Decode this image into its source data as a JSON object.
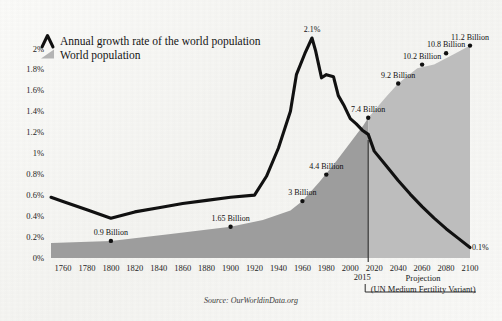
{
  "title": "",
  "source": "Source: OurWorldinData.org",
  "legend": [
    {
      "label": "Annual growth rate of the world population",
      "icon": "peak-line-icon",
      "color": "#111111"
    },
    {
      "label": "World population",
      "icon": "area-wedge-icon",
      "color": "#a8a8a8"
    }
  ],
  "annotations": {
    "divider_year_label": "2015",
    "projection_label": "Projection",
    "projection_sub_label": "(UN Medium Fertility Variant)",
    "peak_label": "2.1%",
    "end_label": "0.1%"
  },
  "colors": {
    "background": "#f7f7f5",
    "line": "#111111",
    "area_historical": "#9d9d9d",
    "area_projection": "#bdbdbd",
    "text": "#1a1a1a"
  },
  "chart_data": {
    "type": "line",
    "title": "",
    "xlabel": "",
    "ylabel": "",
    "xlim": [
      1750,
      2100
    ],
    "ylim": [
      0,
      2.1
    ],
    "grid": false,
    "legend_position": "top-left",
    "x_ticks": [
      1760,
      1780,
      1800,
      1820,
      1840,
      1860,
      1880,
      1900,
      1920,
      1940,
      1960,
      1980,
      2000,
      2020,
      2040,
      2060,
      2080,
      2100
    ],
    "y_ticks": [
      "0%",
      "0.2%",
      "0.4%",
      "0.6%",
      "0.8%",
      "1%",
      "1.2%",
      "1.4%",
      "1.6%",
      "1.8%",
      "2%"
    ],
    "y_tick_values": [
      0,
      0.2,
      0.4,
      0.6,
      0.8,
      1.0,
      1.2,
      1.4,
      1.6,
      1.8,
      2.0
    ],
    "projection_start_year": 2015,
    "series": [
      {
        "name": "Annual growth rate of the world population",
        "unit": "%",
        "x": [
          1750,
          1760,
          1780,
          1800,
          1820,
          1840,
          1860,
          1880,
          1900,
          1920,
          1930,
          1940,
          1950,
          1955,
          1962,
          1968,
          1971,
          1976,
          1980,
          1986,
          1990,
          1995,
          2000,
          2005,
          2010,
          2015,
          2020,
          2030,
          2040,
          2050,
          2060,
          2070,
          2080,
          2090,
          2100
        ],
        "y": [
          0.58,
          0.54,
          0.46,
          0.38,
          0.44,
          0.48,
          0.52,
          0.55,
          0.58,
          0.6,
          0.78,
          1.05,
          1.4,
          1.75,
          1.95,
          2.1,
          1.98,
          1.72,
          1.75,
          1.73,
          1.55,
          1.45,
          1.33,
          1.28,
          1.22,
          1.18,
          1.02,
          0.88,
          0.74,
          0.61,
          0.49,
          0.38,
          0.28,
          0.19,
          0.1
        ]
      },
      {
        "name": "World population",
        "unit": "Billion",
        "x": [
          1750,
          1800,
          1850,
          1900,
          1927,
          1950,
          1960,
          1974,
          1987,
          1999,
          2011,
          2015,
          2030,
          2040,
          2056,
          2070,
          2088,
          2100
        ],
        "y": [
          0.79,
          0.9,
          1.26,
          1.65,
          2.0,
          2.5,
          3.0,
          4.0,
          5.0,
          6.0,
          7.0,
          7.4,
          8.5,
          9.2,
          10.0,
          10.2,
          10.8,
          11.2
        ]
      }
    ],
    "data_labels": [
      {
        "text": "0.9 Billion",
        "year": 1800,
        "value": 0.9,
        "series": "World population"
      },
      {
        "text": "1.65 Billion",
        "year": 1900,
        "value": 1.65,
        "series": "World population"
      },
      {
        "text": "3 Billion",
        "year": 1960,
        "value": 3.0,
        "series": "World population"
      },
      {
        "text": "4.4 Billion",
        "year": 1980,
        "value": 4.4,
        "series": "World population"
      },
      {
        "text": "7.4 Billion",
        "year": 2015,
        "value": 7.4,
        "series": "World population"
      },
      {
        "text": "9.2 Billion",
        "year": 2040,
        "value": 9.2,
        "series": "World population"
      },
      {
        "text": "10.2 Billion",
        "year": 2060,
        "value": 10.2,
        "series": "World population"
      },
      {
        "text": "10.8 Billion",
        "year": 2080,
        "value": 10.8,
        "series": "World population"
      },
      {
        "text": "11.2 Billion",
        "year": 2100,
        "value": 11.2,
        "series": "World population"
      },
      {
        "text": "2.1%",
        "year": 1968,
        "value": 2.1,
        "series": "Annual growth rate of the world population"
      },
      {
        "text": "0.1%",
        "year": 2100,
        "value": 0.1,
        "series": "Annual growth rate of the world population"
      }
    ]
  }
}
